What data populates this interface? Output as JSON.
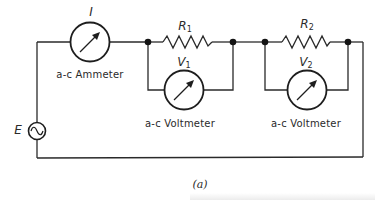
{
  "diagram": {
    "type": "ac-series-circuit",
    "caption": "(a)",
    "source": {
      "label": "E",
      "symbol": "~",
      "kind": "ac-voltage-source"
    },
    "ammeter": {
      "symbol": "I",
      "label": "a-c Ammeter"
    },
    "resistors": [
      {
        "label": "R",
        "sub": "1"
      },
      {
        "label": "R",
        "sub": "2"
      }
    ],
    "voltmeters": [
      {
        "label": "V",
        "sub": "1",
        "caption": "a-c Voltmeter"
      },
      {
        "label": "V",
        "sub": "2",
        "caption": "a-c Voltmeter"
      }
    ],
    "colors": {
      "line": "#2a2a2a",
      "background": "#ffffff"
    }
  }
}
